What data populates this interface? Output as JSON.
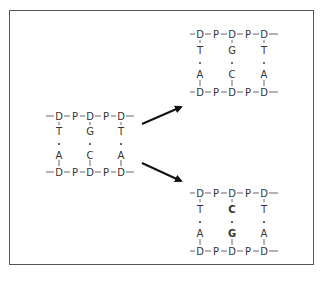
{
  "diagram": {
    "original": {
      "top_strand": [
        "D",
        "P",
        "D",
        "P",
        "D"
      ],
      "bases_top": [
        "T",
        "G",
        "T"
      ],
      "bases_bottom": [
        "A",
        "C",
        "A"
      ],
      "bottom_strand": [
        "D",
        "P",
        "D",
        "P",
        "D"
      ]
    },
    "copy_top": {
      "top_strand": [
        "D",
        "P",
        "D",
        "P",
        "D"
      ],
      "bases_top": [
        "T",
        "G",
        "T"
      ],
      "bases_bottom": [
        "A",
        "C",
        "A"
      ],
      "bottom_strand": [
        "D",
        "P",
        "D",
        "P",
        "D"
      ]
    },
    "copy_bottom": {
      "top_strand": [
        "D",
        "P",
        "D",
        "P",
        "D"
      ],
      "bases_top": [
        "T",
        "C",
        "T"
      ],
      "bases_bottom": [
        "A",
        "G",
        "A"
      ],
      "bottom_strand": [
        "D",
        "P",
        "D",
        "P",
        "D"
      ]
    },
    "colors": {
      "frame": "#555555",
      "text": "#333333",
      "arrow": "#111111"
    }
  }
}
